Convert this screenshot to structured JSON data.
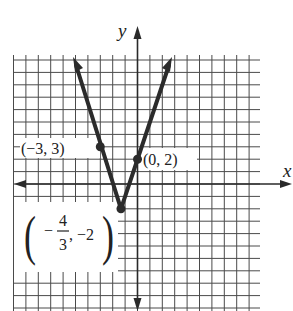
{
  "chart_data": {
    "type": "line",
    "title": "",
    "xlabel": "x",
    "ylabel": "y",
    "grid": true,
    "xlim": [
      -10,
      10
    ],
    "ylim": [
      -10,
      10
    ],
    "function": "y = |3x + 4| - 2",
    "series": [
      {
        "name": "V-shaped graph",
        "points": [
          [
            -7.3,
            10.2
          ],
          [
            -3,
            3
          ],
          [
            -1.3333,
            -2
          ],
          [
            0,
            2
          ],
          [
            3.6,
            10.2
          ]
        ]
      }
    ],
    "highlighted_points": [
      {
        "x": -3,
        "y": 3,
        "label": "(−3, 3)"
      },
      {
        "x": 0,
        "y": 2,
        "label": "(0, 2)"
      },
      {
        "x": -1.3333,
        "y": -2,
        "label_num": "4",
        "label_den": "3",
        "label_rest": ", −2"
      }
    ]
  },
  "axes": {
    "x_label": "x",
    "y_label": "y"
  },
  "labels": {
    "p1": "(−3, 3)",
    "p2": "(0, 2)",
    "vertex_minus": "−",
    "vertex_num": "4",
    "vertex_den": "3",
    "vertex_rest": ", −2"
  }
}
